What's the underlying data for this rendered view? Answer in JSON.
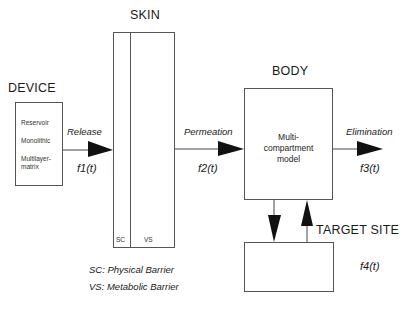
{
  "sections": {
    "device": {
      "title": "DEVICE",
      "types": [
        "Reservoir",
        "Monolithic",
        "Multilayer-",
        "matrix"
      ]
    },
    "skin": {
      "title": "SKIN",
      "layers": [
        "SC",
        "VS"
      ]
    },
    "body": {
      "title": "BODY",
      "model_lines": [
        "Multi-",
        "compartment",
        "model"
      ]
    },
    "target": {
      "title": "TARGET SITE",
      "function": "f4(t)"
    }
  },
  "flows": [
    {
      "label": "Release",
      "function": "f1(t)"
    },
    {
      "label": "Permeation",
      "function": "f2(t)"
    },
    {
      "label": "Elimination",
      "function": "f3(t)"
    }
  ],
  "legend": [
    "SC: Physical Barrier",
    "VS: Metabolic Barrier"
  ]
}
